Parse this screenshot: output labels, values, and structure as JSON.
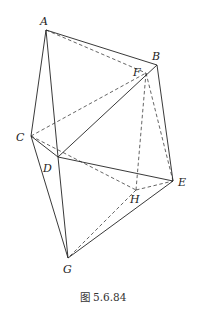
{
  "figure": {
    "caption": "图 5.6.84",
    "vertices": {
      "A": {
        "label": "A",
        "x": 46,
        "y": 30,
        "lx": 40,
        "ly": 25
      },
      "B": {
        "label": "B",
        "x": 157,
        "y": 65,
        "lx": 152,
        "ly": 60
      },
      "C": {
        "label": "C",
        "x": 31,
        "y": 136,
        "lx": 16,
        "ly": 141
      },
      "D": {
        "label": "D",
        "x": 58,
        "y": 157,
        "lx": 43,
        "ly": 172
      },
      "E": {
        "label": "E",
        "x": 173,
        "y": 181,
        "lx": 178,
        "ly": 186
      },
      "F": {
        "label": "F",
        "x": 146,
        "y": 73,
        "lx": 133,
        "ly": 76
      },
      "G": {
        "label": "G",
        "x": 68,
        "y": 258,
        "lx": 63,
        "ly": 273
      },
      "H": {
        "label": "H",
        "x": 136,
        "y": 190,
        "lx": 130,
        "ly": 203
      }
    },
    "solid_edges": [
      [
        "A",
        "B"
      ],
      [
        "A",
        "C"
      ],
      [
        "A",
        "D"
      ],
      [
        "B",
        "D"
      ],
      [
        "B",
        "E"
      ],
      [
        "C",
        "D"
      ],
      [
        "C",
        "G"
      ],
      [
        "D",
        "E"
      ],
      [
        "D",
        "G"
      ],
      [
        "E",
        "G"
      ]
    ],
    "dashed_edges": [
      [
        "A",
        "F"
      ],
      [
        "C",
        "F"
      ],
      [
        "F",
        "H"
      ],
      [
        "F",
        "E"
      ],
      [
        "C",
        "H"
      ],
      [
        "H",
        "E"
      ],
      [
        "H",
        "G"
      ]
    ]
  }
}
